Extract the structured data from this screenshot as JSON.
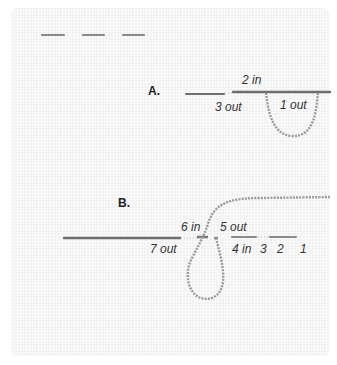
{
  "diagram": {
    "colors": {
      "fabric": "#f1f1f1",
      "needle": "#6e6e6e",
      "thread": "#9a9a9a",
      "stitch": "#8a8a8a",
      "label": "#333333"
    },
    "top_stitches": 3,
    "step_a": {
      "label": "A.",
      "points": [
        "2 in",
        "3 out",
        "1 out"
      ]
    },
    "step_b": {
      "label": "B.",
      "points": [
        "6 in",
        "5 out",
        "7 out",
        "4 in",
        "3",
        "2",
        "1"
      ]
    }
  }
}
